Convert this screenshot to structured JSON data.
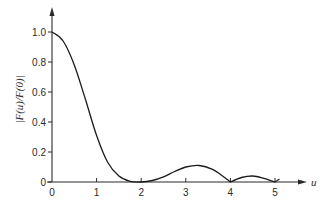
{
  "chart_data": {
    "type": "line",
    "title": "",
    "xlabel": "u",
    "ylabel": "|F(u)/F(0)|",
    "xlim": [
      0,
      5.4
    ],
    "ylim": [
      0,
      1.1
    ],
    "grid": false,
    "legend": null,
    "x_ticks": [
      "0",
      "1",
      "2",
      "3",
      "4",
      "5"
    ],
    "y_ticks": [
      "0",
      "0.2",
      "0.4",
      "0.6",
      "0.8",
      "1.0"
    ],
    "series": [
      {
        "name": "|F(u)/F(0)|",
        "x": [
          0,
          0.25,
          0.5,
          0.75,
          1.0,
          1.25,
          1.5,
          1.75,
          2.0,
          2.25,
          2.5,
          2.75,
          3.0,
          3.3,
          3.6,
          3.8,
          4.0,
          4.25,
          4.5,
          4.75,
          5.0,
          5.1
        ],
        "values": [
          1.0,
          0.94,
          0.78,
          0.55,
          0.31,
          0.13,
          0.04,
          0.005,
          0.0,
          0.01,
          0.035,
          0.07,
          0.1,
          0.11,
          0.085,
          0.045,
          0.0,
          0.03,
          0.04,
          0.025,
          0.0,
          0.02
        ]
      }
    ]
  }
}
